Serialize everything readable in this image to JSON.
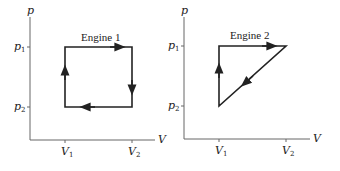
{
  "diagrams": [
    {
      "title": "Engine 1",
      "y_axis_label": "p",
      "x_axis_label": "V",
      "y_ticks": [
        {
          "main": "p",
          "sub": "1"
        },
        {
          "main": "p",
          "sub": "2"
        }
      ],
      "x_ticks": [
        {
          "main": "V",
          "sub": "1"
        },
        {
          "main": "V",
          "sub": "2"
        }
      ],
      "cycle_shape": "rectangle",
      "path_direction": "clockwise: V1p2 → V1p1 → V2p1 → V2p2 → V1p2"
    },
    {
      "title": "Engine 2",
      "y_axis_label": "p",
      "x_axis_label": "V",
      "y_ticks": [
        {
          "main": "p",
          "sub": "1"
        },
        {
          "main": "p",
          "sub": "2"
        }
      ],
      "x_ticks": [
        {
          "main": "V",
          "sub": "1"
        },
        {
          "main": "V",
          "sub": "2"
        }
      ],
      "cycle_shape": "triangle",
      "path_direction": "clockwise: V1p2 → V1p1 → V2p1 → V1p2"
    }
  ],
  "colors": {
    "line": "#222222",
    "axis": "#555555",
    "background": "#ffffff"
  }
}
